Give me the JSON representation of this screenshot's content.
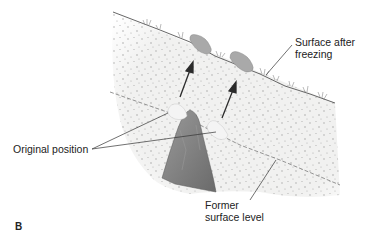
{
  "figure": {
    "panel_letter": "B",
    "labels": {
      "surface_after_freezing_line1": "Surface after",
      "surface_after_freezing_line2": "freezing",
      "original_position": "Original position",
      "former_surface_line1": "Former",
      "former_surface_line2": "surface level"
    },
    "colors": {
      "soil_fill": "#f1f1f0",
      "soil_speckle": "#9a9a9a",
      "surface_line": "#555555",
      "dashed_line": "#7a7a7a",
      "heaved_stone": "#a9a9a9",
      "original_stone": "#f4f4f4",
      "bedrock": "#7b7b7b",
      "arrow": "#2b2b2b",
      "leader_line": "#333333",
      "grass": "#8c8c8c"
    }
  }
}
